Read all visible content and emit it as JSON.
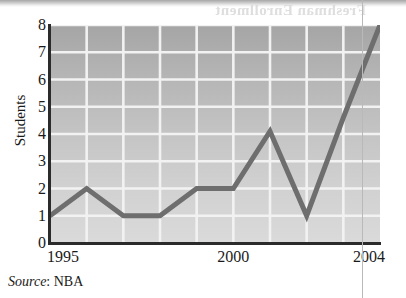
{
  "page": {
    "bleed_text": "Freshman Enrollment",
    "column_rule_color": "#b9b9b9"
  },
  "source_note": {
    "label": "Source",
    "separator": ":",
    "value": "NBA"
  },
  "colors": {
    "line": "#6e6e6e",
    "gridline": "#f2f2f2",
    "axis": "#2b2b2b",
    "plot_top": "#a5a5a5",
    "plot_bottom": "#dadada",
    "text": "#1a1a1a"
  },
  "chart_data": {
    "type": "line",
    "title": "",
    "xlabel": "",
    "ylabel": "Students",
    "x": [
      1995,
      1996,
      1997,
      1998,
      1999,
      2000,
      2001,
      2002,
      2003,
      2004
    ],
    "values": [
      1,
      2,
      1,
      1,
      2,
      2,
      4.1,
      1,
      4.6,
      8
    ],
    "series": [
      {
        "name": "Students",
        "values": [
          1,
          2,
          1,
          1,
          2,
          2,
          4.1,
          1,
          4.6,
          8
        ]
      }
    ],
    "xlim": [
      1995,
      2004
    ],
    "ylim": [
      0,
      8
    ],
    "yticks": [
      0,
      1,
      2,
      3,
      4,
      5,
      6,
      7,
      8
    ],
    "ytick_labels": [
      "0",
      "1",
      "2",
      "3",
      "4",
      "5",
      "6",
      "7",
      "8"
    ],
    "xticks": [
      1995,
      2000,
      2004
    ],
    "xtick_labels": [
      "1995",
      "2000",
      "2004"
    ],
    "grid": true,
    "grid_axis": "both",
    "legend": false,
    "markers": false,
    "source": "Source: NBA"
  }
}
